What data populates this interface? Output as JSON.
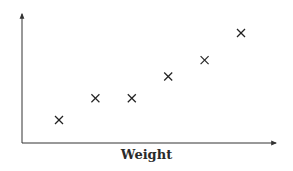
{
  "chart_data": {
    "type": "scatter",
    "title": "",
    "xlabel": "Weight",
    "ylabel": "",
    "marker": "x",
    "grid": false,
    "legend": null,
    "x": [
      1,
      2,
      3,
      4,
      5,
      6
    ],
    "y": [
      1,
      2,
      2,
      3,
      3.75,
      5
    ],
    "xlim": [
      0,
      7
    ],
    "ylim": [
      0,
      6
    ]
  },
  "colors": {
    "axis": "#333333",
    "marker": "#222222"
  }
}
